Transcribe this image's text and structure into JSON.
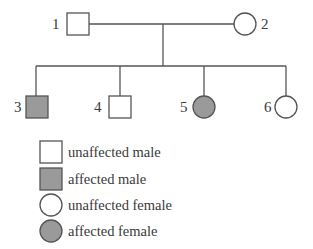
{
  "colors": {
    "affected": "#9a9a9a",
    "unaffected": "#ffffff",
    "stroke": "#555555"
  },
  "generations": [
    {
      "level": "I",
      "individuals": [
        {
          "id": "1",
          "label": "1",
          "sex": "male",
          "affected": false
        },
        {
          "id": "2",
          "label": "2",
          "sex": "female",
          "affected": false
        }
      ]
    },
    {
      "level": "II",
      "individuals": [
        {
          "id": "3",
          "label": "3",
          "sex": "male",
          "affected": true
        },
        {
          "id": "4",
          "label": "4",
          "sex": "male",
          "affected": false
        },
        {
          "id": "5",
          "label": "5",
          "sex": "female",
          "affected": true
        },
        {
          "id": "6",
          "label": "6",
          "sex": "female",
          "affected": false
        }
      ]
    }
  ],
  "relationships": [
    {
      "type": "mating",
      "partners": [
        "1",
        "2"
      ],
      "children": [
        "3",
        "4",
        "5",
        "6"
      ]
    }
  ],
  "legend": [
    {
      "symbol": "square",
      "fill": "unaffected",
      "label": "unaffected male"
    },
    {
      "symbol": "square",
      "fill": "affected",
      "label": "affected male"
    },
    {
      "symbol": "circle",
      "fill": "unaffected",
      "label": "unaffected female"
    },
    {
      "symbol": "circle",
      "fill": "affected",
      "label": "affected female"
    }
  ]
}
